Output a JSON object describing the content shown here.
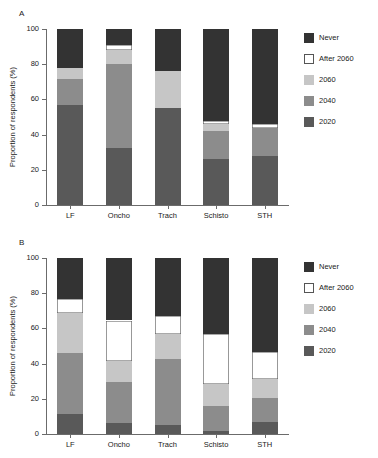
{
  "figure": {
    "panels": [
      {
        "id": "A",
        "label": "A"
      },
      {
        "id": "B",
        "label": "B"
      }
    ],
    "ylabel": "Proportion of respondents (%)",
    "yticks": [
      "0",
      "20",
      "40",
      "60",
      "80",
      "100"
    ],
    "categories": [
      "LF",
      "Oncho",
      "Trach",
      "Schisto",
      "STH"
    ],
    "legend": [
      {
        "key": "never",
        "label": "Never",
        "color": "#333333"
      },
      {
        "key": "after",
        "label": "After 2060",
        "color": "#ffffff"
      },
      {
        "key": "y2060",
        "label": "2060",
        "color": "#c6c6c6"
      },
      {
        "key": "y2040",
        "label": "2040",
        "color": "#8c8c8c"
      },
      {
        "key": "y2020",
        "label": "2020",
        "color": "#595959"
      }
    ]
  },
  "chart_data": [
    {
      "type": "bar",
      "panel": "A",
      "title": "A",
      "stacked": true,
      "xlabel": "",
      "ylabel": "Proportion of respondents (%)",
      "ylim": [
        0,
        100
      ],
      "ytick_values": [
        0,
        20,
        40,
        60,
        80,
        100
      ],
      "grid": false,
      "legend_position": "right",
      "categories": [
        "LF",
        "Oncho",
        "Trach",
        "Schisto",
        "STH"
      ],
      "series": [
        {
          "name": "2020",
          "color": "#595959",
          "values": [
            57.0,
            32.5,
            55.0,
            26.0,
            28.0
          ]
        },
        {
          "name": "2040",
          "color": "#8c8c8c",
          "values": [
            14.5,
            47.5,
            0.0,
            16.0,
            16.0
          ]
        },
        {
          "name": "2060",
          "color": "#c6c6c6",
          "values": [
            6.5,
            8.0,
            21.0,
            4.0,
            0.0
          ]
        },
        {
          "name": "After 2060",
          "color": "#ffffff",
          "values": [
            0.0,
            3.0,
            0.0,
            2.0,
            2.0
          ]
        },
        {
          "name": "Never",
          "color": "#333333",
          "values": [
            22.0,
            9.0,
            24.0,
            52.0,
            54.0
          ]
        }
      ]
    },
    {
      "type": "bar",
      "panel": "B",
      "title": "B",
      "stacked": true,
      "xlabel": "",
      "ylabel": "Proportion of respondents (%)",
      "ylim": [
        0,
        100
      ],
      "ytick_values": [
        0,
        20,
        40,
        60,
        80,
        100
      ],
      "grid": false,
      "legend_position": "right",
      "categories": [
        "LF",
        "Oncho",
        "Trach",
        "Schisto",
        "STH"
      ],
      "series": [
        {
          "name": "2020",
          "color": "#595959",
          "values": [
            11.5,
            6.0,
            5.0,
            1.5,
            7.0
          ]
        },
        {
          "name": "2040",
          "color": "#8c8c8c",
          "values": [
            34.5,
            23.5,
            37.5,
            14.5,
            13.5
          ]
        },
        {
          "name": "2060",
          "color": "#c6c6c6",
          "values": [
            23.0,
            12.0,
            14.5,
            12.5,
            10.5
          ]
        },
        {
          "name": "After 2060",
          "color": "#ffffff",
          "values": [
            7.5,
            23.0,
            10.0,
            28.5,
            15.5
          ]
        },
        {
          "name": "Never",
          "color": "#333333",
          "values": [
            23.5,
            35.5,
            33.0,
            43.0,
            53.5
          ]
        }
      ]
    }
  ]
}
